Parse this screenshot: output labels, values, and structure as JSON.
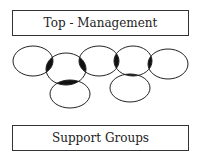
{
  "diagram": {
    "top_box": {
      "label": "Top - Management"
    },
    "bottom_box": {
      "label": "Support Groups"
    },
    "colors": {
      "stroke": "#222222",
      "fill_overlap": "#111111",
      "background": "#ffffff"
    },
    "ellipses": [
      {
        "id": "group-1",
        "cx": 33,
        "cy": 61,
        "rx": 20,
        "ry": 15
      },
      {
        "id": "group-2",
        "cx": 66,
        "cy": 69,
        "rx": 20,
        "ry": 16
      },
      {
        "id": "group-3",
        "cx": 99,
        "cy": 61,
        "rx": 20,
        "ry": 15
      },
      {
        "id": "group-4",
        "cx": 133,
        "cy": 61,
        "rx": 19,
        "ry": 15
      },
      {
        "id": "group-5",
        "cx": 168,
        "cy": 64,
        "rx": 20,
        "ry": 15
      },
      {
        "id": "group-6",
        "cx": 70,
        "cy": 94,
        "rx": 20,
        "ry": 14
      },
      {
        "id": "group-7",
        "cx": 130,
        "cy": 88,
        "rx": 20,
        "ry": 14
      }
    ]
  }
}
